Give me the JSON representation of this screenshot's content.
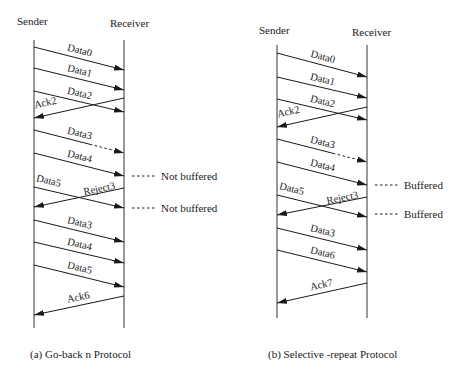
{
  "diagrams": [
    {
      "id": "go-back-n",
      "caption": "(a) Go-back n Protocol",
      "caption_pos": [
        30,
        358
      ],
      "sender": {
        "label": "Sender",
        "x": 34,
        "label_pos": [
          17,
          25
        ],
        "y_top": 40,
        "y_bottom": 328
      },
      "receiver": {
        "label": "Receiver",
        "x": 124,
        "label_pos": [
          110,
          27
        ],
        "y_top": 40,
        "y_bottom": 328
      },
      "messages": [
        {
          "label": "Data0",
          "dir": "s2r",
          "y1": 47,
          "y2": 70
        },
        {
          "label": "Data1",
          "dir": "s2r",
          "y1": 68,
          "y2": 90
        },
        {
          "label": "Data2",
          "dir": "s2r",
          "y1": 91,
          "y2": 112
        },
        {
          "label": "Ack2",
          "dir": "r2s",
          "y1": 98,
          "y2": 118
        },
        {
          "label": "Data3",
          "dir": "s2r",
          "y1": 130,
          "y2": 153,
          "lost": true
        },
        {
          "label": "Data4",
          "dir": "s2r",
          "y1": 153,
          "y2": 176
        },
        {
          "label": "Data5",
          "dir": "s2r",
          "y1": 187,
          "y2": 208
        },
        {
          "label": "Reject3",
          "dir": "r2s",
          "y1": 188,
          "y2": 207
        },
        {
          "label": "Data3",
          "dir": "s2r",
          "y1": 220,
          "y2": 242
        },
        {
          "label": "Data4",
          "dir": "s2r",
          "y1": 242,
          "y2": 263
        },
        {
          "label": "Data5",
          "dir": "s2r",
          "y1": 265,
          "y2": 287
        },
        {
          "label": "Ack6",
          "dir": "r2s",
          "y1": 296,
          "y2": 315
        }
      ],
      "notes": [
        {
          "text": "Not buffered",
          "y": 176
        },
        {
          "text": "Not buffered",
          "y": 208
        }
      ]
    },
    {
      "id": "selective-repeat",
      "caption": "(b) Selective -repeat Protocol",
      "caption_pos": [
        268,
        358
      ],
      "sender": {
        "label": "Sender",
        "x": 277,
        "label_pos": [
          259,
          34
        ],
        "y_top": 45,
        "y_bottom": 318
      },
      "receiver": {
        "label": "Receiver",
        "x": 367,
        "label_pos": [
          352,
          36
        ],
        "y_top": 45,
        "y_bottom": 318
      },
      "messages": [
        {
          "label": "Data0",
          "dir": "s2r",
          "y1": 53,
          "y2": 77
        },
        {
          "label": "Data1",
          "dir": "s2r",
          "y1": 77,
          "y2": 98
        },
        {
          "label": "Data2",
          "dir": "s2r",
          "y1": 99,
          "y2": 120
        },
        {
          "label": "Ack2",
          "dir": "r2s",
          "y1": 107,
          "y2": 127
        },
        {
          "label": "Data3",
          "dir": "s2r",
          "y1": 139,
          "y2": 162,
          "lost": true
        },
        {
          "label": "Data4",
          "dir": "s2r",
          "y1": 162,
          "y2": 185
        },
        {
          "label": "Data5",
          "dir": "s2r",
          "y1": 195,
          "y2": 217
        },
        {
          "label": "Reject3",
          "dir": "r2s",
          "y1": 197,
          "y2": 215
        },
        {
          "label": "Data3",
          "dir": "s2r",
          "y1": 228,
          "y2": 250
        },
        {
          "label": "Data6",
          "dir": "s2r",
          "y1": 250,
          "y2": 272
        },
        {
          "label": "Ack7",
          "dir": "r2s",
          "y1": 283,
          "y2": 303
        }
      ],
      "notes": [
        {
          "text": "Buffered",
          "y": 185
        },
        {
          "text": "Buffered",
          "y": 214
        }
      ]
    }
  ],
  "colors": {
    "line": "#1a1a1a",
    "background": "#ffffff"
  }
}
